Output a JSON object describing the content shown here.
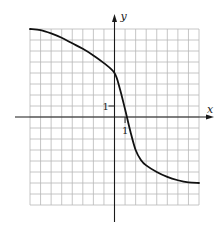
{
  "chart_data": {
    "type": "line",
    "title": "",
    "xlabel": "x",
    "ylabel": "y",
    "xlim": [
      -8,
      8
    ],
    "ylim": [
      -8,
      8
    ],
    "grid": true,
    "grid_step": 1,
    "tick_labels": {
      "x": [
        {
          "value": 1,
          "label": "1"
        }
      ],
      "y": [
        {
          "value": 1,
          "label": "1"
        }
      ]
    },
    "series": [
      {
        "name": "f(x)",
        "x": [
          -8,
          -7,
          -6,
          -5,
          -4,
          -3,
          -2,
          -1,
          0,
          0.5,
          1,
          1.5,
          2,
          2.5,
          3,
          4,
          5,
          6,
          7,
          8
        ],
        "y": [
          8,
          7.9,
          7.6,
          7.2,
          6.7,
          6.2,
          5.6,
          4.9,
          4,
          2.6,
          0.7,
          -1.3,
          -3,
          -3.9,
          -4.4,
          -5.0,
          -5.45,
          -5.75,
          -5.95,
          -6
        ]
      }
    ],
    "legend": null
  },
  "labels": {
    "x_axis": "x",
    "y_axis": "y",
    "x_tick_one": "1",
    "y_tick_one": "1"
  }
}
